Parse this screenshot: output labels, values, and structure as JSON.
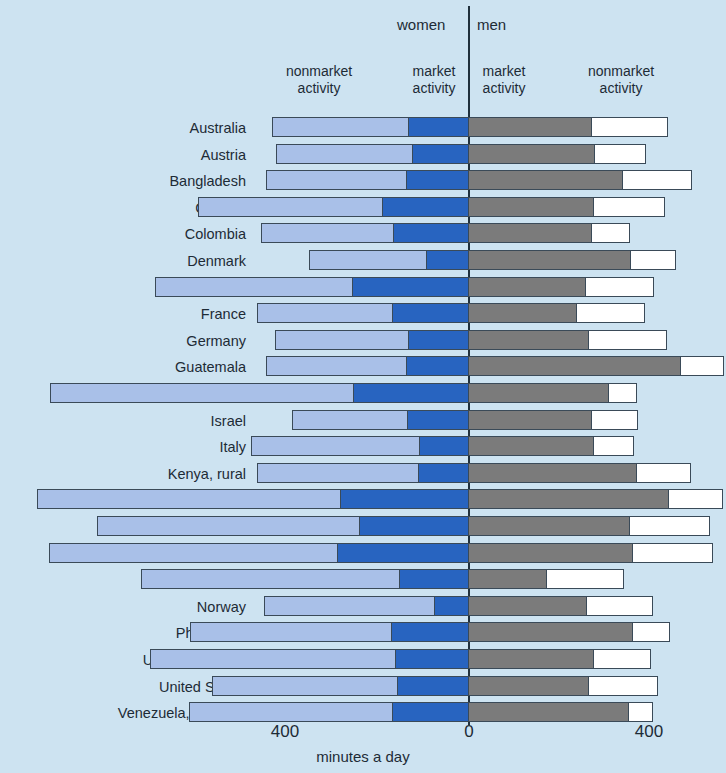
{
  "header": {
    "women_label": "women",
    "men_label": "men",
    "women_nonmarket_label": "nonmarket\nactivity",
    "women_market_label": "market\nactivity",
    "men_market_label": "market\nactivity",
    "men_nonmarket_label": "nonmarket\nactivity"
  },
  "axis": {
    "tick_left": "400",
    "tick_zero": "0",
    "tick_right": "400",
    "title": "minutes a day"
  },
  "colors": {
    "background": "#cde3f1",
    "women_nonmarket": "#a9c0e8",
    "women_market": "#2864c0",
    "men_market": "#7b7b7b",
    "men_nonmarket": "#ffffff",
    "outline": "#3a4a58",
    "zero_line": "#20303c"
  },
  "chart_data": {
    "type": "bar",
    "subtype": "diverging-stacked-horizontal",
    "title": "",
    "xlabel": "minutes a day",
    "ylabel": "",
    "xlim": [
      -400,
      400
    ],
    "xticks": [
      -400,
      0,
      400
    ],
    "xtick_labels": [
      "400",
      "0",
      "400"
    ],
    "grid": false,
    "legend_position": "top",
    "units": "minutes a day",
    "series": [
      {
        "name": "women nonmarket activity",
        "side": "left",
        "color": "#a9c0e8"
      },
      {
        "name": "women market activity",
        "side": "left",
        "color": "#2864c0"
      },
      {
        "name": "men market activity",
        "side": "right",
        "color": "#7b7b7b"
      },
      {
        "name": "men nonmarket activity",
        "side": "right",
        "color": "#ffffff"
      }
    ],
    "categories": [
      "Australia",
      "Austria",
      "Bangladesh",
      "Canada",
      "Colombia",
      "Denmark",
      "Finland",
      "France",
      "Germany",
      "Guatemala",
      "Indonesia",
      "Israel",
      "Italy",
      "Kenya, rural",
      "Kenya, urban",
      "Nepal, rural",
      "Nepal, urban",
      "Netherlands",
      "Norway",
      "Philippines",
      "United Kingdom",
      "United States",
      "Venezuela, R. B. de"
    ],
    "rows": [
      {
        "country": "Australia",
        "women_nonmarket": 297,
        "women_market": 131,
        "men_market": 269,
        "men_nonmarket": 166
      },
      {
        "country": "Austria",
        "women_nonmarket": 297,
        "women_market": 122,
        "men_market": 275,
        "men_nonmarket": 112
      },
      {
        "country": "Bangladesh",
        "women_nonmarket": 306,
        "women_market": 135,
        "men_market": 337,
        "men_nonmarket": 149
      },
      {
        "country": "Canada",
        "women_nonmarket": 402,
        "women_market": 188,
        "men_market": 273,
        "men_nonmarket": 155
      },
      {
        "country": "Colombia",
        "women_nonmarket": 289,
        "women_market": 164,
        "men_market": 269,
        "men_nonmarket": 83
      },
      {
        "country": "Denmark",
        "women_nonmarket": 255,
        "women_market": 92,
        "men_market": 354,
        "men_nonmarket": 98
      },
      {
        "country": "Finland",
        "women_nonmarket": 430,
        "women_market": 254,
        "men_market": 256,
        "men_nonmarket": 149
      },
      {
        "country": "France",
        "women_nonmarket": 295,
        "women_market": 166,
        "men_market": 236,
        "men_nonmarket": 149
      },
      {
        "country": "Germany",
        "women_nonmarket": 290,
        "women_market": 131,
        "men_market": 262,
        "men_nonmarket": 171
      },
      {
        "country": "Guatemala",
        "women_nonmarket": 306,
        "women_market": 136,
        "men_market": 463,
        "men_nonmarket": 94
      },
      {
        "country": "Indonesia",
        "women_nonmarket": 662,
        "women_market": 251,
        "men_market": 306,
        "men_nonmarket": 61
      },
      {
        "country": "Israel",
        "women_nonmarket": 252,
        "women_market": 133,
        "men_market": 269,
        "men_nonmarket": 100
      },
      {
        "country": "Italy",
        "women_nonmarket": 367,
        "women_market": 107,
        "men_market": 273,
        "men_nonmarket": 87
      },
      {
        "country": "Kenya, rural",
        "women_nonmarket": 352,
        "women_market": 109,
        "men_market": 367,
        "men_nonmarket": 118
      },
      {
        "country": "Kenya, urban",
        "women_nonmarket": 662,
        "women_market": 280,
        "men_market": 437,
        "men_nonmarket": 118
      },
      {
        "country": "Nepal, rural",
        "women_nonmarket": 574,
        "women_market": 238,
        "men_market": 352,
        "men_nonmarket": 175
      },
      {
        "country": "Nepal, urban",
        "women_nonmarket": 629,
        "women_market": 286,
        "men_market": 358,
        "men_nonmarket": 175
      },
      {
        "country": "Netherlands",
        "women_nonmarket": 563,
        "women_market": 151,
        "men_market": 171,
        "men_nonmarket": 168
      },
      {
        "country": "Norway",
        "women_nonmarket": 371,
        "women_market": 74,
        "men_market": 258,
        "men_nonmarket": 144
      },
      {
        "country": "Philippines",
        "women_nonmarket": 440,
        "women_market": 168,
        "men_market": 358,
        "men_nonmarket": 81
      },
      {
        "country": "United Kingdom",
        "women_nonmarket": 536,
        "women_market": 160,
        "men_market": 273,
        "men_nonmarket": 125
      },
      {
        "country": "United States",
        "women_nonmarket": 404,
        "women_market": 155,
        "men_market": 262,
        "men_nonmarket": 151
      },
      {
        "country": "Venezuela, R. B. de",
        "women_nonmarket": 444,
        "women_market": 166,
        "men_market": 350,
        "men_nonmarket": 52
      }
    ]
  }
}
